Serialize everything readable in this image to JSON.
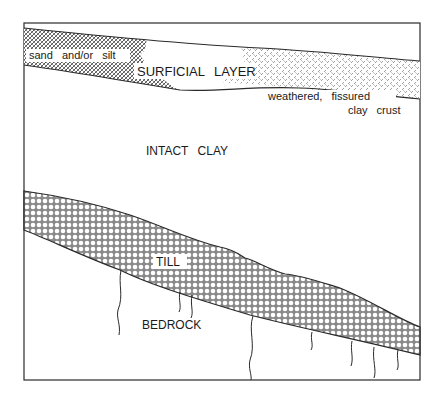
{
  "diagram": {
    "type": "geologic-cross-section",
    "colors": {
      "line": "#2a2a2a",
      "background": "#ffffff",
      "pattern": "#555555"
    },
    "layers": [
      {
        "id": "surficial",
        "label": "SURFICIAL LAYER"
      },
      {
        "id": "sand-silt",
        "label": "sand and/or silt"
      },
      {
        "id": "crust",
        "label_line1": "weathered, fissured",
        "label_line2": "clay crust"
      },
      {
        "id": "intact-clay",
        "label": "INTACT CLAY"
      },
      {
        "id": "till",
        "label": "TILL"
      },
      {
        "id": "bedrock",
        "label": "BEDROCK"
      }
    ]
  }
}
